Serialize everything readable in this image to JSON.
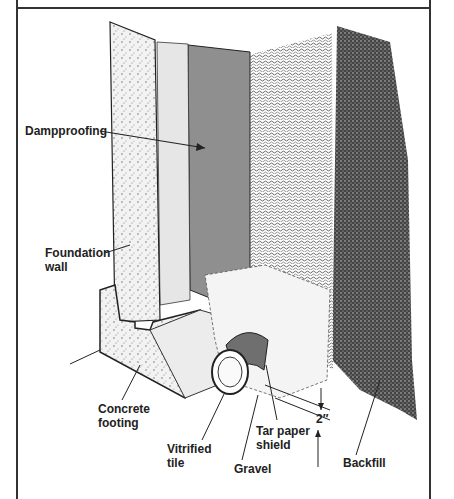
{
  "figure": {
    "type": "cross-section illustration",
    "labels": [
      {
        "id": "dampproofing",
        "text": "Dampproofing"
      },
      {
        "id": "foundation-wall",
        "text": "Foundation\nwall"
      },
      {
        "id": "concrete-footing",
        "text": "Concrete\nfooting"
      },
      {
        "id": "vitrified-tile",
        "text": "Vitrified\ntile"
      },
      {
        "id": "gravel",
        "text": "Gravel"
      },
      {
        "id": "tar-paper-shield",
        "text": "Tar paper\nshield"
      },
      {
        "id": "dimension",
        "text": "2″"
      },
      {
        "id": "backfill",
        "text": "Backfill"
      }
    ]
  },
  "colors": {
    "frame": "#333333",
    "dampproofing": "#8f8f8f",
    "wall_face": "#e6e6e6",
    "backfill": "#3a3a3a",
    "shield": "#6f6f6f"
  }
}
